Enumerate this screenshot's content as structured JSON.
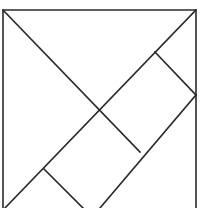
{
  "diagram": {
    "type": "tangram-square-dissection",
    "title": "Tangram square",
    "stroke_color": "#2a2a2a",
    "background": "#ffffff",
    "outline": {
      "points": "3,208 3,10 196,10 196,208"
    },
    "segments": [
      {
        "id": "main-diagonal",
        "x1": 3,
        "y1": 10,
        "x2": 140,
        "y2": 152
      },
      {
        "id": "anti-diagonal",
        "x1": 196,
        "y1": 10,
        "x2": 5,
        "y2": 208
      },
      {
        "id": "upper-right-cut",
        "x1": 155,
        "y1": 52,
        "x2": 196,
        "y2": 95
      },
      {
        "id": "right-lower-diagonal",
        "x1": 196,
        "y1": 95,
        "x2": 100,
        "y2": 208
      },
      {
        "id": "lower-left-cut",
        "x1": 44,
        "y1": 169,
        "x2": 83,
        "y2": 208
      }
    ]
  }
}
